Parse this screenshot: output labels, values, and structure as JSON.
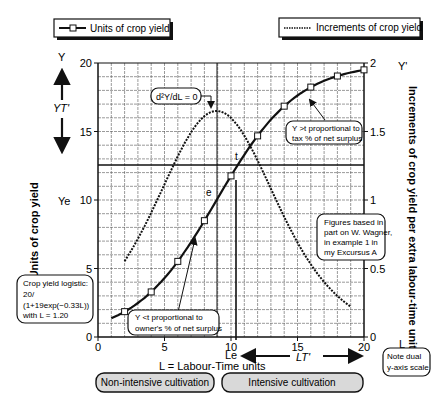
{
  "legend": {
    "units_label": "Units of crop yield",
    "increments_label": "Increments of crop yield"
  },
  "axes": {
    "left_top_label": "Y",
    "right_top_label": "Y'",
    "left_ylabel": "Y = Units of crop yield",
    "right_ylabel": "Increments of crop yield per extra labour-time unit",
    "xlabel": "L = Labour-Time units",
    "left_ticks": [
      "0",
      "5",
      "10",
      "15",
      "20"
    ],
    "right_ticks": [
      "0",
      "0.5",
      "1",
      "1.5",
      "2"
    ],
    "x_ticks": [
      "0",
      "5",
      "10",
      "15",
      "20"
    ],
    "right_bottom_label": "L"
  },
  "annotations": {
    "yt": "YT'",
    "ye": "Ye",
    "le": "Le",
    "lt": "LT'",
    "e": "e",
    "t": "t",
    "inflection": "d²Y/dL = 0",
    "above_t_line1": "Y >t proportional to",
    "above_t_line2": "tax % of net surplus",
    "below_t_line1": "Y <t proportional to",
    "below_t_line2": "owner's % of net surplus",
    "source_line1": "Figures based in",
    "source_line2": "part on W. Wagner,",
    "source_line3": "in example 1 in",
    "source_line4": "my Excursus A",
    "formula_line1": "Crop yield logistic:",
    "formula_line2": "20/",
    "formula_line3": "(1+19exp(−0.33L))",
    "formula_line4": "with L = 1.20",
    "note_line1": "Note dual",
    "note_line2": "y-axis scale"
  },
  "bottom": {
    "non_intensive": "Non-intensive cultivation",
    "intensive": "Intensive cultivation"
  },
  "colors": {
    "line": "#111111",
    "grid": "#555555",
    "box_fill": "#d9d9d9"
  },
  "chart_data": {
    "type": "line",
    "title": "",
    "xlabel": "L = Labour-Time units",
    "ylabel": "Y = Units of crop yield",
    "y2label": "Increments of crop yield per extra labour-time unit",
    "xlim": [
      0,
      20
    ],
    "ylim": [
      0,
      20
    ],
    "y2lim": [
      0,
      2
    ],
    "grid": true,
    "legend_position": "top",
    "series": [
      {
        "name": "Units of crop yield",
        "axis": "left",
        "style": "solid-with-square-markers",
        "x": [
          1,
          2,
          4,
          6,
          8,
          10,
          12,
          14,
          16,
          18,
          20
        ],
        "values": [
          1.33,
          1.85,
          3.29,
          5.52,
          8.49,
          11.76,
          14.68,
          16.85,
          18.24,
          19.05,
          19.5
        ]
      },
      {
        "name": "Increments of crop yield",
        "axis": "right",
        "style": "dotted",
        "x": [
          2,
          3,
          4,
          5,
          6,
          7,
          8,
          8.9,
          10,
          11,
          12,
          13,
          14,
          15,
          16,
          17,
          18,
          19
        ],
        "values": [
          0.55,
          0.74,
          0.97,
          1.21,
          1.43,
          1.58,
          1.65,
          1.65,
          1.6,
          1.46,
          1.26,
          1.04,
          0.83,
          0.63,
          0.48,
          0.36,
          0.27,
          0.2
        ]
      }
    ],
    "reference_lines": [
      {
        "type": "vertical",
        "x": 8.9,
        "label": "d²Y/dL = 0"
      },
      {
        "type": "vertical",
        "x": 10.4,
        "label": "Le"
      },
      {
        "type": "horizontal",
        "y": 12.5,
        "label": "Ye"
      }
    ]
  }
}
